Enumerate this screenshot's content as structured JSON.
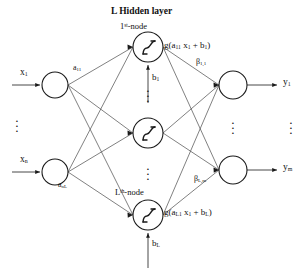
{
  "figure": {
    "type": "neural-network-diagram",
    "title": "L Hidden layer",
    "background_color": "#ffffff",
    "stroke_color": "#1a1a1a",
    "width": 307,
    "height": 270
  },
  "labels": {
    "title": "L Hidden layer",
    "first_node": "1",
    "first_node_sup": "st",
    "first_node_suffix": "-node",
    "last_node": "L",
    "last_node_sup": "th",
    "last_node_suffix": "-node",
    "top_activation_fn": "g(a",
    "top_activation_sub1": "11",
    "top_activation_mid": " x",
    "top_activation_sub2": "1",
    "top_activation_tail": " + b",
    "top_activation_sub3": "1",
    "top_activation_close": ")",
    "bottom_activation_fn": "g(a",
    "bottom_activation_sub1": "L1",
    "bottom_activation_mid": " x",
    "bottom_activation_sub2": "1",
    "bottom_activation_tail": " + b",
    "bottom_activation_sub3": "L",
    "bottom_activation_close": ")"
  },
  "inputs": [
    {
      "name": "x",
      "sub": "1",
      "y": 85
    },
    {
      "name": "x",
      "sub": "n",
      "y": 172
    }
  ],
  "outputs": [
    {
      "name": "y",
      "sub": "1",
      "y": 85
    },
    {
      "name": "y",
      "sub": "m",
      "y": 170
    }
  ],
  "weights": {
    "input_first": "a",
    "input_first_sub": "11",
    "input_last": "a",
    "input_last_sub": "nL",
    "output_first": "β",
    "output_first_sub": "1,1",
    "output_last": "β",
    "output_last_sub": "L,m"
  },
  "biases": [
    {
      "name": "b",
      "sub": "1"
    },
    {
      "name": "b",
      "sub": "L"
    }
  ],
  "ellipsis": {
    "glyph": "·",
    "input_column": "vertical-dots",
    "hidden_column_upper": "vertical-dots",
    "hidden_column_lower": "vertical-dots",
    "output_column": "vertical-dots",
    "far_right_column": "vertical-dots"
  },
  "geometry": {
    "input_nodes": [
      {
        "cx": 55,
        "cy": 85,
        "r": 13
      },
      {
        "cx": 55,
        "cy": 172,
        "r": 13
      }
    ],
    "hidden_nodes": [
      {
        "cx": 148,
        "cy": 47,
        "r": 15
      },
      {
        "cx": 148,
        "cy": 133,
        "r": 15
      },
      {
        "cx": 148,
        "cy": 215,
        "r": 15
      }
    ],
    "output_nodes": [
      {
        "cx": 233,
        "cy": 85,
        "r": 14
      },
      {
        "cx": 233,
        "cy": 170,
        "r": 14
      }
    ]
  }
}
